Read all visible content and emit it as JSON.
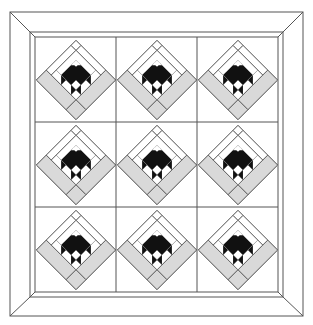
{
  "diagram": {
    "type": "quilt-layout",
    "grid": {
      "rows": 3,
      "cols": 3
    },
    "block_name": "on-point flower block",
    "colors": {
      "background": "#ffffff",
      "outline": "#555555",
      "light_gray": "#d9d9d9",
      "dark": "#111111",
      "white": "#ffffff"
    },
    "outer_frame": {
      "x1": 10,
      "y1": 12,
      "x2": 303,
      "y2": 316
    },
    "inner_border": {
      "x1": 30,
      "y1": 32,
      "x2": 283,
      "y2": 297
    },
    "field": {
      "x1": 35,
      "y1": 37,
      "x2": 278,
      "y2": 292
    },
    "column_lines_x": [
      116,
      197
    ],
    "row_lines_y": [
      122,
      207
    ]
  }
}
